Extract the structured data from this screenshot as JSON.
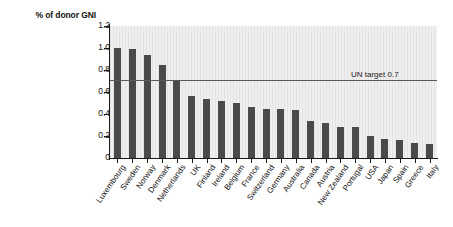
{
  "chart_data": {
    "type": "bar",
    "title": "",
    "subtitle": "",
    "xlabel": "",
    "ylabel": "% of donor GNI",
    "ylim": [
      0,
      1.2
    ],
    "ytick_labels": [
      "1.2",
      "1.0",
      "0.8",
      "0.6",
      "0.4",
      "0.2",
      "0"
    ],
    "ytick_values": [
      1.2,
      1.0,
      0.8,
      0.6,
      0.4,
      0.2,
      0
    ],
    "grid": false,
    "legend": "none",
    "bar_color": "#4a4a4a",
    "plot_background": "#ebebeb",
    "categories": [
      "Luxembourg",
      "Sweden",
      "Norway",
      "Denmark",
      "Netherlands",
      "UK",
      "Finland",
      "Ireland",
      "Belgium",
      "France",
      "Switzerland",
      "Germany",
      "Australia",
      "Canada",
      "Austria",
      "New Zealand",
      "Portugal",
      "USA",
      "Japan",
      "Spain",
      "Greece",
      "Italy"
    ],
    "values": [
      1.0,
      0.99,
      0.94,
      0.85,
      0.71,
      0.56,
      0.54,
      0.52,
      0.5,
      0.46,
      0.45,
      0.45,
      0.44,
      0.34,
      0.32,
      0.28,
      0.28,
      0.2,
      0.17,
      0.16,
      0.14,
      0.13
    ],
    "annotations": [
      {
        "name": "un-target",
        "label": "UN target 0.7",
        "value": 0.7,
        "orientation": "horizontal",
        "color": "#5a5a5a"
      }
    ]
  },
  "axis": {
    "y_title": "% of donor GNI"
  },
  "annotation": {
    "un_target_label": "UN target 0.7"
  }
}
